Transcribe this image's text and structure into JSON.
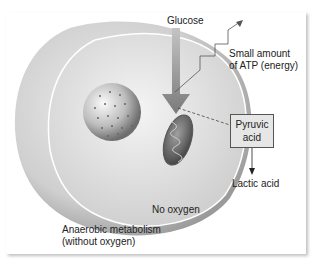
{
  "labels": {
    "glucose": "Glucose",
    "atp": "Small amount",
    "atp2": "of ATP (energy)",
    "pyruvic1": "Pyruvic",
    "pyruvic2": "acid",
    "lactic": "Lactic acid",
    "no_oxygen": "No oxygen",
    "title1": "Anaerobic metabolism",
    "title2": "(without oxygen)"
  },
  "colors": {
    "arrow": "#8a8a8a",
    "box": "#e6e6e6",
    "cell": "#d4d4d4"
  }
}
